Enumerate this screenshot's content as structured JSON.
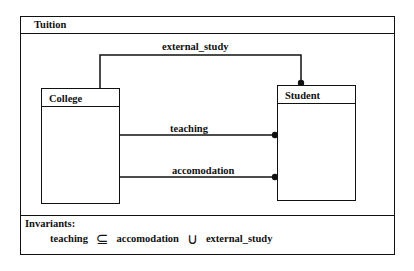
{
  "diagram": {
    "title": "Tuition",
    "classes": [
      {
        "name": "College"
      },
      {
        "name": "Student"
      }
    ],
    "associations": [
      {
        "label": "external_study",
        "from": "College",
        "to": "Student"
      },
      {
        "label": "teaching",
        "from": "College",
        "to": "Student"
      },
      {
        "label": "accomodation",
        "from": "College",
        "to": "Student"
      }
    ],
    "invariants": {
      "heading": "Invariants:",
      "expression": {
        "lhs": "teaching",
        "subset_symbol": "⊆",
        "term1": "accomodation",
        "union_symbol": "∪",
        "term2": "external_study"
      }
    }
  }
}
